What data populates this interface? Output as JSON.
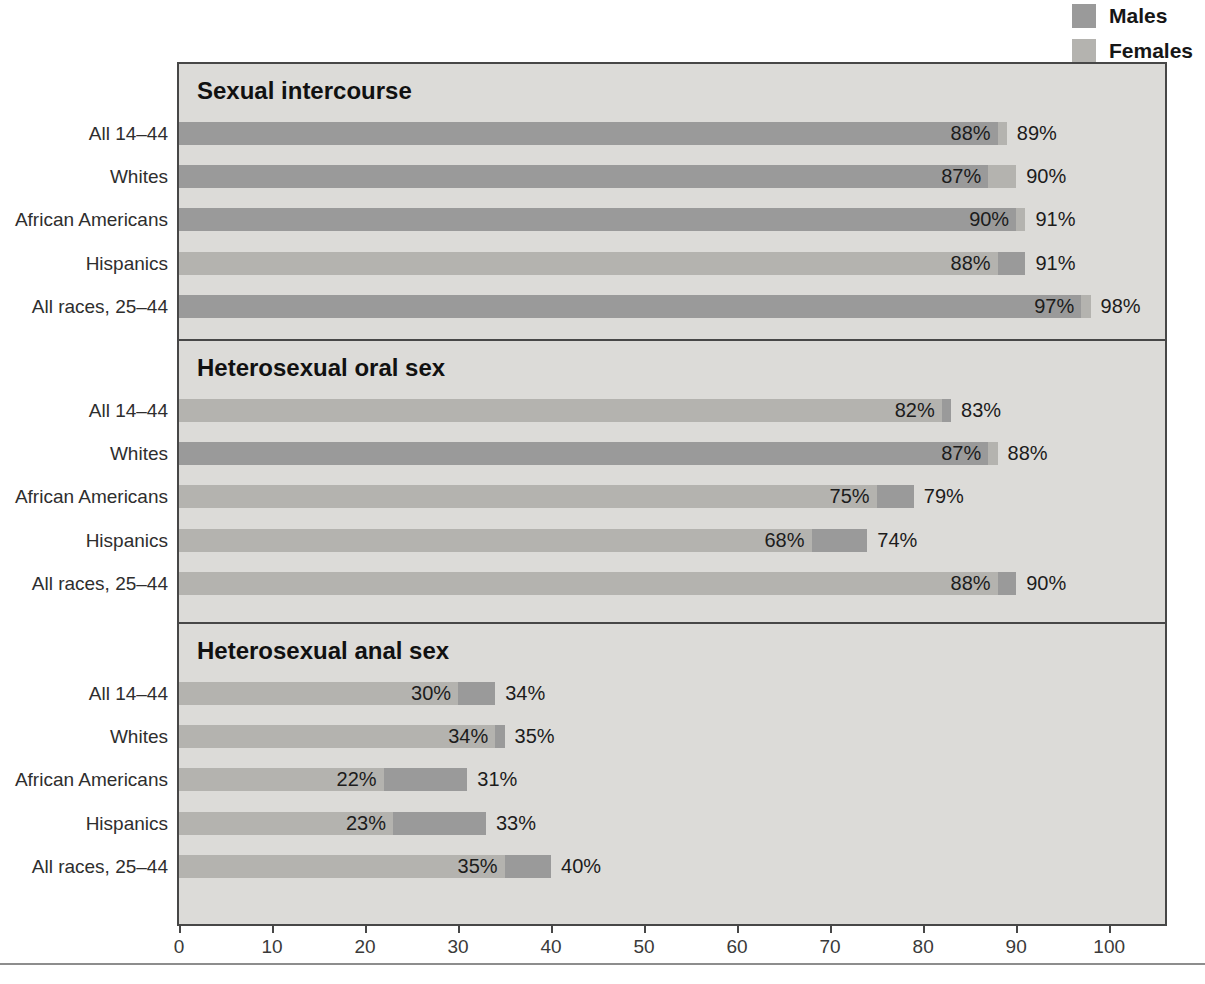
{
  "legend": {
    "items": [
      {
        "label": "Males",
        "color": "#9a9a9a"
      },
      {
        "label": "Females",
        "color": "#b4b3af"
      }
    ]
  },
  "colors": {
    "males_bar": "#9a9a9a",
    "females_bar": "#b4b3af",
    "panel_background": "#dcdbd8",
    "panel_border": "#474747",
    "text": "#1c1c1c"
  },
  "chart_data": {
    "type": "bar",
    "orientation": "horizontal",
    "categories": [
      "All 14–44",
      "Whites",
      "African Americans",
      "Hispanics",
      "All races, 25–44"
    ],
    "panels": [
      {
        "title": "Sexual intercourse",
        "series": [
          {
            "name": "Males",
            "values": [
              88,
              87,
              90,
              91,
              97
            ]
          },
          {
            "name": "Females",
            "values": [
              89,
              90,
              91,
              88,
              98
            ]
          }
        ]
      },
      {
        "title": "Heterosexual oral sex",
        "series": [
          {
            "name": "Males",
            "values": [
              83,
              87,
              79,
              74,
              90
            ]
          },
          {
            "name": "Females",
            "values": [
              82,
              88,
              75,
              68,
              88
            ]
          }
        ]
      },
      {
        "title": "Heterosexual anal sex",
        "series": [
          {
            "name": "Males",
            "values": [
              34,
              35,
              31,
              33,
              40
            ]
          },
          {
            "name": "Females",
            "values": [
              30,
              34,
              22,
              23,
              35
            ]
          }
        ]
      }
    ],
    "xlabel": "",
    "ylabel": "",
    "xlim": [
      0,
      106
    ],
    "tick_values": [
      0,
      10,
      20,
      30,
      40,
      50,
      60,
      70,
      80,
      90,
      100
    ],
    "tick_labels": [
      "0",
      "10",
      "20",
      "30",
      "40",
      "50",
      "60",
      "70",
      "80",
      "90",
      "100"
    ],
    "value_label_format": "{v}%",
    "grid": false,
    "legend_position": "top-right",
    "note": "Overlapping bars: smaller value drawn in front of larger value"
  }
}
